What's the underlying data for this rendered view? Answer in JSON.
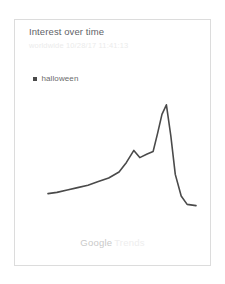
{
  "card": {
    "title": "Interest over time",
    "subtitle": "worldwide 10/28/17 11:41:13",
    "border_color": "#dcdcdc",
    "background_color": "#ffffff"
  },
  "legend": {
    "items": [
      {
        "label": "halloween",
        "marker": "square-marker",
        "color": "#4a4a4a"
      }
    ]
  },
  "footer": {
    "brand_primary": "Google",
    "brand_secondary": "Trends",
    "brand_primary_color": "#c9c9c9",
    "brand_secondary_color": "#eeeeee"
  },
  "chart_data": {
    "type": "line",
    "title": "Interest over time",
    "subtitle": "worldwide 10/28/17 11:41:13",
    "xlabel": "",
    "ylabel": "",
    "xlim": [
      0,
      100
    ],
    "ylim": [
      0,
      100
    ],
    "grid": false,
    "axes_visible": false,
    "tick_labels": {
      "x": [],
      "y": []
    },
    "legend_position": "top-left",
    "line_color": "#4a4a4a",
    "line_width": 1.6,
    "series": [
      {
        "name": "halloween",
        "color": "#4a4a4a",
        "x": [
          0,
          6,
          13,
          20,
          27,
          34,
          41,
          48,
          53,
          58,
          62,
          67,
          71,
          74,
          77,
          80,
          83,
          86,
          90,
          94,
          100
        ],
        "values": [
          22,
          23,
          25,
          27,
          29,
          32,
          35,
          40,
          48,
          58,
          52,
          55,
          57,
          72,
          88,
          96,
          70,
          38,
          20,
          13,
          12
        ]
      }
    ],
    "annotations": [
      {
        "text": "peak",
        "x": 80,
        "y": 96
      },
      {
        "text": "local-bump",
        "x": 58,
        "y": 58
      }
    ]
  }
}
